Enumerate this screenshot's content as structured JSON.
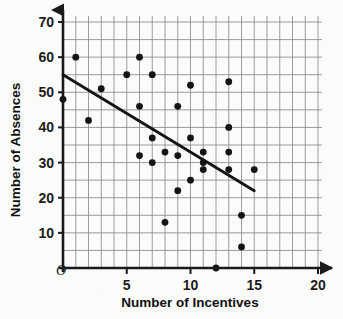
{
  "chart_data": {
    "type": "scatter",
    "title": "",
    "xlabel": "Number of Incentives",
    "ylabel": "Number of Absences",
    "xlim": [
      0,
      20
    ],
    "ylim": [
      0,
      70
    ],
    "xticks": [
      5,
      10,
      15,
      20
    ],
    "yticks": [
      10,
      20,
      30,
      40,
      50,
      60,
      70
    ],
    "xtick_labels": [
      "5",
      "10",
      "15",
      "20"
    ],
    "ytick_labels": [
      "10",
      "20",
      "30",
      "40",
      "50",
      "60",
      "70"
    ],
    "x_minor_step": 1,
    "y_minor_step": 5,
    "grid": true,
    "grid_color": "#8c8c8c",
    "origin_label": "O",
    "legend": null,
    "point_color": "#141414",
    "line_color": "#141414",
    "points": [
      {
        "x": 0,
        "y": 48
      },
      {
        "x": 1,
        "y": 60
      },
      {
        "x": 2,
        "y": 42
      },
      {
        "x": 3,
        "y": 51
      },
      {
        "x": 5,
        "y": 55
      },
      {
        "x": 6,
        "y": 60
      },
      {
        "x": 6,
        "y": 46
      },
      {
        "x": 6,
        "y": 32
      },
      {
        "x": 7,
        "y": 55
      },
      {
        "x": 7,
        "y": 37
      },
      {
        "x": 7,
        "y": 30
      },
      {
        "x": 8,
        "y": 33
      },
      {
        "x": 8,
        "y": 13
      },
      {
        "x": 9,
        "y": 46
      },
      {
        "x": 9,
        "y": 32
      },
      {
        "x": 9,
        "y": 22
      },
      {
        "x": 10,
        "y": 52
      },
      {
        "x": 10,
        "y": 37
      },
      {
        "x": 10,
        "y": 25
      },
      {
        "x": 11,
        "y": 33
      },
      {
        "x": 11,
        "y": 30
      },
      {
        "x": 11,
        "y": 28
      },
      {
        "x": 12,
        "y": 0
      },
      {
        "x": 13,
        "y": 53
      },
      {
        "x": 13,
        "y": 40
      },
      {
        "x": 13,
        "y": 33
      },
      {
        "x": 13,
        "y": 28
      },
      {
        "x": 14,
        "y": 15
      },
      {
        "x": 14,
        "y": 6
      },
      {
        "x": 15,
        "y": 28
      }
    ],
    "trend_line": {
      "name": "line of best fit",
      "x_start": 0,
      "y_start": 55,
      "x_end": 15,
      "y_end": 22
    }
  }
}
